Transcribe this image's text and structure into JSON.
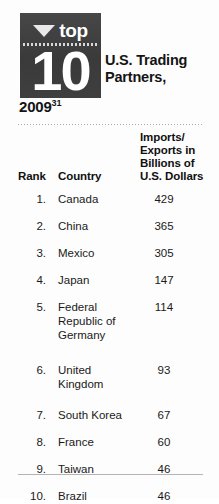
{
  "badge": {
    "triangle_icon": "triangle-down-icon",
    "top_label": "top",
    "number": "10"
  },
  "title": {
    "headline": "U.S. Trading Partners,",
    "year": "2009",
    "footnote_marker": "31"
  },
  "table": {
    "headers": {
      "rank": "Rank",
      "country": "Country",
      "value": "Imports/ Exports in Billions of U.S. Dollars"
    },
    "rows": [
      {
        "rank": "1.",
        "country": "Canada",
        "value": "429"
      },
      {
        "rank": "2.",
        "country": "China",
        "value": "365"
      },
      {
        "rank": "3.",
        "country": "Mexico",
        "value": "305"
      },
      {
        "rank": "4.",
        "country": "Japan",
        "value": "147"
      },
      {
        "rank": "5.",
        "country": "Federal Republic of Germany",
        "value": "114"
      },
      {
        "rank": "6.",
        "country": "United Kingdom",
        "value": "93"
      },
      {
        "rank": "7.",
        "country": "South Korea",
        "value": "67"
      },
      {
        "rank": "8.",
        "country": "France",
        "value": "60"
      },
      {
        "rank": "9.",
        "country": "Taiwan",
        "value": "46"
      },
      {
        "rank": "10.",
        "country": "Brazil",
        "value": "46"
      }
    ]
  },
  "chart_data": {
    "type": "table",
    "title": "Top 10 U.S. Trading Partners, 2009",
    "xlabel": "",
    "ylabel": "Imports/Exports in Billions of U.S. Dollars",
    "categories": [
      "Canada",
      "China",
      "Mexico",
      "Japan",
      "Federal Republic of Germany",
      "United Kingdom",
      "South Korea",
      "France",
      "Taiwan",
      "Brazil"
    ],
    "values": [
      429,
      365,
      305,
      147,
      114,
      93,
      67,
      60,
      46,
      46
    ],
    "ranks": [
      1,
      2,
      3,
      4,
      5,
      6,
      7,
      8,
      9,
      10
    ],
    "units": "Billions of U.S. Dollars",
    "year": 2009,
    "footnote_marker": "31",
    "legend": [],
    "grid": false
  },
  "colors": {
    "badge_background": "#3f3f3f",
    "badge_text": "#ffffff",
    "page_background": "#fdfdfd",
    "text": "#1a1a1a",
    "rule": "#b4b4b4"
  }
}
